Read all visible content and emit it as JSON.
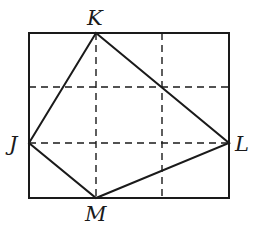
{
  "diagram": {
    "type": "quadrilateral-on-grid",
    "rectangle": {
      "x": 29,
      "y": 33,
      "width": 200,
      "height": 165
    },
    "grid_lines": {
      "vertical_x": [
        96,
        162
      ],
      "horizontal_y": [
        87,
        143
      ]
    },
    "vertices": [
      {
        "name": "K",
        "x": 96,
        "y": 33,
        "label_x": 87,
        "label_y": 25
      },
      {
        "name": "L",
        "x": 229,
        "y": 143,
        "label_x": 235,
        "label_y": 151
      },
      {
        "name": "M",
        "x": 96,
        "y": 198,
        "label_x": 85,
        "label_y": 221
      },
      {
        "name": "J",
        "x": 29,
        "y": 143,
        "label_x": 9,
        "label_y": 151
      }
    ],
    "polygon_order": [
      "J",
      "K",
      "L",
      "M"
    ],
    "colors": {
      "stroke": "#1a1a1a",
      "background": "#ffffff"
    }
  }
}
